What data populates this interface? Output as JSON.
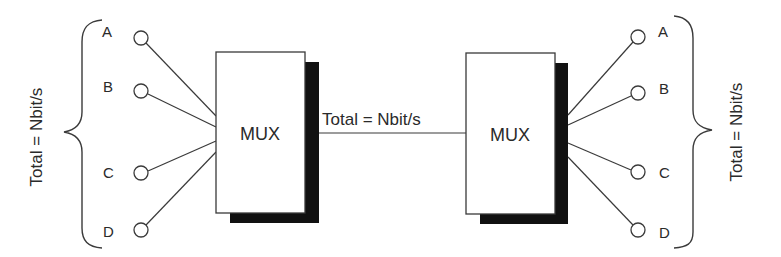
{
  "diagram": {
    "colors": {
      "stroke": "#3a3a3a",
      "shadow": "#111111",
      "text": "#2a2a2a",
      "background": "#ffffff"
    },
    "left": {
      "total_label": "Total = Nbit/s",
      "channels": [
        {
          "label": "A",
          "cy": 38
        },
        {
          "label": "B",
          "cy": 91
        },
        {
          "label": "C",
          "cy": 173
        },
        {
          "label": "D",
          "cy": 230
        }
      ]
    },
    "left_mux": {
      "label": "MUX"
    },
    "link": {
      "label": "Total = Nbit/s"
    },
    "right_mux": {
      "label": "MUX"
    },
    "right": {
      "total_label": "Total = Nbit/s",
      "channels": [
        {
          "label": "A",
          "cy": 37
        },
        {
          "label": "B",
          "cy": 93
        },
        {
          "label": "C",
          "cy": 172
        },
        {
          "label": "D",
          "cy": 230
        }
      ]
    }
  }
}
